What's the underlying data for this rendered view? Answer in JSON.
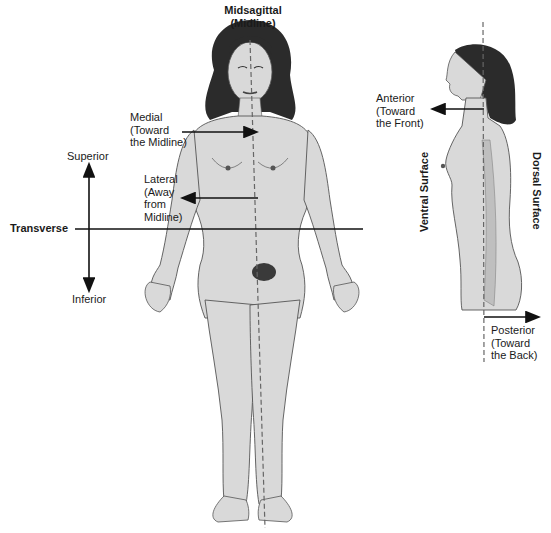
{
  "figure": {
    "colors": {
      "skin": "#d9d9d9",
      "skin_shade": "#bfbfbf",
      "outline": "#555555",
      "hair": "#2b2b2b",
      "line": "#111111",
      "dashed": "#666666",
      "background": "#ffffff"
    }
  },
  "labels": {
    "midsagittal": {
      "line1": "Midsagittal",
      "line2": "(Midline)"
    },
    "medial": {
      "line1": "Medial",
      "line2": "(Toward",
      "line3": "the Midline)"
    },
    "lateral": {
      "line1": "Lateral",
      "line2": "(Away",
      "line3": "from",
      "line4": "Midline)"
    },
    "superior": "Superior",
    "inferior": "Inferior",
    "transverse": "Transverse",
    "anterior": {
      "line1": "Anterior",
      "line2": "(Toward",
      "line3": "the Front)"
    },
    "ventral_surface": "Ventral Surface",
    "dorsal_surface": "Dorsal Surface",
    "posterior": {
      "line1": "Posterior",
      "line2": "(Toward",
      "line3": "the Back)"
    }
  }
}
